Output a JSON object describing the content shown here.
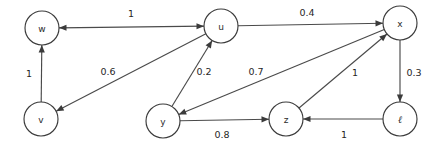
{
  "diagram": {
    "type": "directed-graph",
    "background_color": "#ffffff",
    "stroke_color": "#4a4a4a",
    "node_fill_color": "#ffffff",
    "node_stroke_color": "#3b3b3b",
    "text_color": "#262626",
    "node_radius": 17
  },
  "nodes": [
    {
      "id": "w",
      "label": "w",
      "x": 42,
      "y": 28,
      "style": "plain"
    },
    {
      "id": "u",
      "label": "u",
      "x": 221,
      "y": 26,
      "style": "plain"
    },
    {
      "id": "x",
      "label": "x",
      "x": 400,
      "y": 23,
      "style": "plain"
    },
    {
      "id": "v",
      "label": "v",
      "x": 41,
      "y": 119,
      "style": "plain"
    },
    {
      "id": "y",
      "label": "y",
      "x": 163,
      "y": 121,
      "style": "plain"
    },
    {
      "id": "z",
      "label": "z",
      "x": 286,
      "y": 119,
      "style": "plain"
    },
    {
      "id": "l",
      "label": "ℓ",
      "x": 400,
      "y": 119,
      "style": "italic"
    }
  ],
  "edges": [
    {
      "id": "w-u",
      "from": "w",
      "to": "u",
      "weight": "1",
      "directed": "both",
      "label_x": 131,
      "label_y": 13
    },
    {
      "id": "u-x",
      "from": "u",
      "to": "x",
      "weight": "0.4",
      "directed": "forward",
      "label_x": 307,
      "label_y": 12
    },
    {
      "id": "u-v",
      "from": "u",
      "to": "v",
      "weight": "0.6",
      "directed": "forward",
      "label_x": 108,
      "label_y": 71
    },
    {
      "id": "v-w",
      "from": "v",
      "to": "w",
      "weight": "1",
      "directed": "forward",
      "label_x": 29,
      "label_y": 73
    },
    {
      "id": "y-u",
      "from": "y",
      "to": "u",
      "weight": "0.2",
      "directed": "forward",
      "label_x": 204,
      "label_y": 71
    },
    {
      "id": "x-y",
      "from": "x",
      "to": "y",
      "weight": "0.7",
      "directed": "forward",
      "label_x": 256,
      "label_y": 71
    },
    {
      "id": "x-l",
      "from": "x",
      "to": "l",
      "weight": "0.3",
      "directed": "forward",
      "label_x": 414,
      "label_y": 72
    },
    {
      "id": "y-z",
      "from": "y",
      "to": "z",
      "weight": "0.8",
      "directed": "forward",
      "label_x": 222,
      "label_y": 134
    },
    {
      "id": "z-x",
      "from": "z",
      "to": "x",
      "weight": "1",
      "directed": "forward",
      "label_x": 355,
      "label_y": 72
    },
    {
      "id": "l-z",
      "from": "l",
      "to": "z",
      "weight": "1",
      "directed": "forward",
      "label_x": 344,
      "label_y": 134
    }
  ]
}
